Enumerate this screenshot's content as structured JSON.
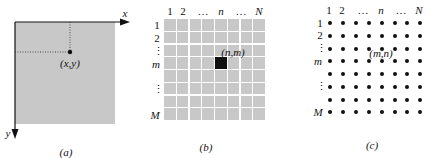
{
  "colors": {
    "gray_fill": "#c8c8c8",
    "ink": "#111111",
    "grid_gap": "#ffffff"
  },
  "panel_a": {
    "x_axis_label": "x",
    "y_axis_label": "y",
    "point_label": "(x,y)",
    "caption": "(a)"
  },
  "panel_b": {
    "column_labels": [
      "1",
      "2",
      "…",
      "n",
      "…",
      "N"
    ],
    "row_labels": [
      "1",
      "2",
      "⋮",
      "m",
      "⋮",
      "M"
    ],
    "highlight_label": "(n,m)",
    "grid_rows": 8,
    "grid_cols": 8,
    "highlight_cell": {
      "row": 4,
      "col": 5
    },
    "caption": "(b)"
  },
  "panel_c": {
    "column_labels": [
      "1",
      "2",
      "…",
      "n",
      "…",
      "N"
    ],
    "row_labels": [
      "1",
      "2",
      "⋮",
      "m",
      "⋮",
      "M"
    ],
    "point_label": "(m,n)",
    "grid_rows": 8,
    "grid_cols": 8,
    "caption": "(c)"
  }
}
